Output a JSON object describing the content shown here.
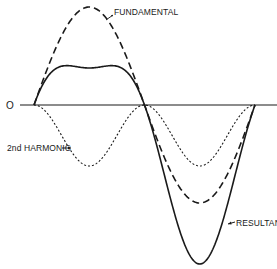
{
  "diagram": {
    "title": "",
    "axis": {
      "origin_label": "O"
    },
    "labels": {
      "fundamental": "FUNDAMENTAL",
      "second_harmonic": "2nd HARMONIC",
      "resultant": "RESULTANT"
    },
    "curves": [
      {
        "name": "fundamental",
        "style": "long-dash",
        "amplitude_px": 98,
        "cycles": 1
      },
      {
        "name": "second_harmonic",
        "style": "short-dash",
        "amplitude_px": 61,
        "shape": "-sin^2"
      },
      {
        "name": "resultant",
        "style": "solid",
        "formula": "fundamental + second_harmonic"
      }
    ],
    "colors": {
      "line": "#1a1a1a",
      "background": "#ffffff"
    }
  }
}
